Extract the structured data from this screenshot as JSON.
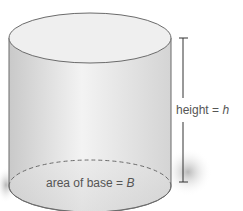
{
  "diagram": {
    "type": "cylinder",
    "labels": {
      "height_text": "height = ",
      "height_var": "h",
      "base_text": "area of base = ",
      "base_var": "B"
    },
    "colors": {
      "outline": "#6b6b6b",
      "body_light": "#f2f2f2",
      "body_dark": "#cfcfcf",
      "top_face": "#efefef",
      "shadow": "#bdbdbd",
      "label": "#555555",
      "base_var": "#6a6a6a"
    }
  }
}
